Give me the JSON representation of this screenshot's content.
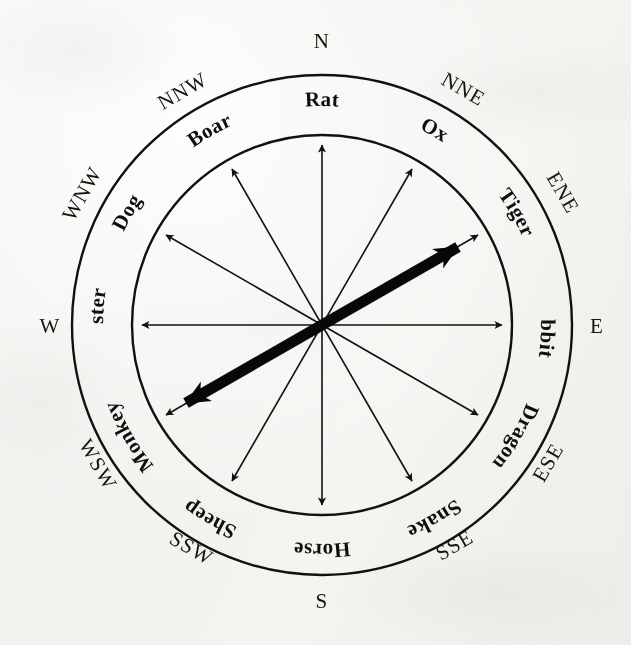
{
  "figure": {
    "kind": "zodiac-compass-rose",
    "background_color": "#f4f3f0",
    "ink_color": "#13110f",
    "center": {
      "x": 322,
      "y": 325
    },
    "outer_radius": 250,
    "inner_radius": 190,
    "ring_label_radius": 219
  },
  "compass_points": [
    {
      "id": "n",
      "label": "N",
      "bearing_deg": 0,
      "upright": true
    },
    {
      "id": "nne",
      "label": "NNE",
      "bearing_deg": 30,
      "upright": false
    },
    {
      "id": "ene",
      "label": "ENE",
      "bearing_deg": 60,
      "upright": false
    },
    {
      "id": "e",
      "label": "E",
      "bearing_deg": 90,
      "upright": true
    },
    {
      "id": "ese",
      "label": "ESE",
      "bearing_deg": 120,
      "upright": false
    },
    {
      "id": "sse",
      "label": "SSE",
      "bearing_deg": 150,
      "upright": false
    },
    {
      "id": "s",
      "label": "S",
      "bearing_deg": 180,
      "upright": true
    },
    {
      "id": "ssw",
      "label": "SSW",
      "bearing_deg": 210,
      "upright": false
    },
    {
      "id": "wsw",
      "label": "WSW",
      "bearing_deg": 240,
      "upright": false
    },
    {
      "id": "w",
      "label": "W",
      "bearing_deg": 270,
      "upright": true
    },
    {
      "id": "wnw",
      "label": "WNW",
      "bearing_deg": 300,
      "upright": false
    },
    {
      "id": "nnw",
      "label": "NNW",
      "bearing_deg": 330,
      "upright": false
    }
  ],
  "zodiac_animals": [
    {
      "id": "rat",
      "label": "Rat",
      "bearing_deg": 0,
      "compass": "N"
    },
    {
      "id": "ox",
      "label": "Ox",
      "bearing_deg": 30,
      "compass": "NNE"
    },
    {
      "id": "tiger",
      "label": "Tiger",
      "bearing_deg": 60,
      "compass": "ENE"
    },
    {
      "id": "rabbit",
      "label": "Rabbit",
      "bearing_deg": 90,
      "compass": "E"
    },
    {
      "id": "dragon",
      "label": "Dragon",
      "bearing_deg": 120,
      "compass": "ESE"
    },
    {
      "id": "snake",
      "label": "Snake",
      "bearing_deg": 150,
      "compass": "SSE"
    },
    {
      "id": "horse",
      "label": "Horse",
      "bearing_deg": 180,
      "compass": "S"
    },
    {
      "id": "sheep",
      "label": "Sheep",
      "bearing_deg": 210,
      "compass": "SSW"
    },
    {
      "id": "monkey",
      "label": "Monkey",
      "bearing_deg": 240,
      "compass": "WSW"
    },
    {
      "id": "rooster",
      "label": "Rooster",
      "bearing_deg": 270,
      "compass": "W"
    },
    {
      "id": "dog",
      "label": "Dog",
      "bearing_deg": 300,
      "compass": "WNW"
    },
    {
      "id": "boar",
      "label": "Boar",
      "bearing_deg": 330,
      "compass": "NNW"
    }
  ],
  "thin_arrows": [
    {
      "id": "rat-horse",
      "bearing_deg": 0,
      "from": "Horse",
      "to": "Rat"
    },
    {
      "id": "ox-sheep",
      "bearing_deg": 30,
      "from": "Sheep",
      "to": "Ox"
    },
    {
      "id": "tiger-monkey",
      "bearing_deg": 60,
      "from": "Monkey",
      "to": "Tiger"
    },
    {
      "id": "rabbit-rooster",
      "bearing_deg": 90,
      "from": "Rooster",
      "to": "Rabbit"
    },
    {
      "id": "dragon-dog",
      "bearing_deg": 120,
      "from": "Dog",
      "to": "Dragon"
    },
    {
      "id": "snake-boar",
      "bearing_deg": 150,
      "from": "Boar",
      "to": "Snake"
    }
  ],
  "highlight_arrow": {
    "id": "tiger-monkey-axis",
    "bearing_deg": 60,
    "from": "Monkey",
    "to": "Tiger",
    "double_headed": true,
    "stroke_width": 11,
    "color": "#090807"
  }
}
